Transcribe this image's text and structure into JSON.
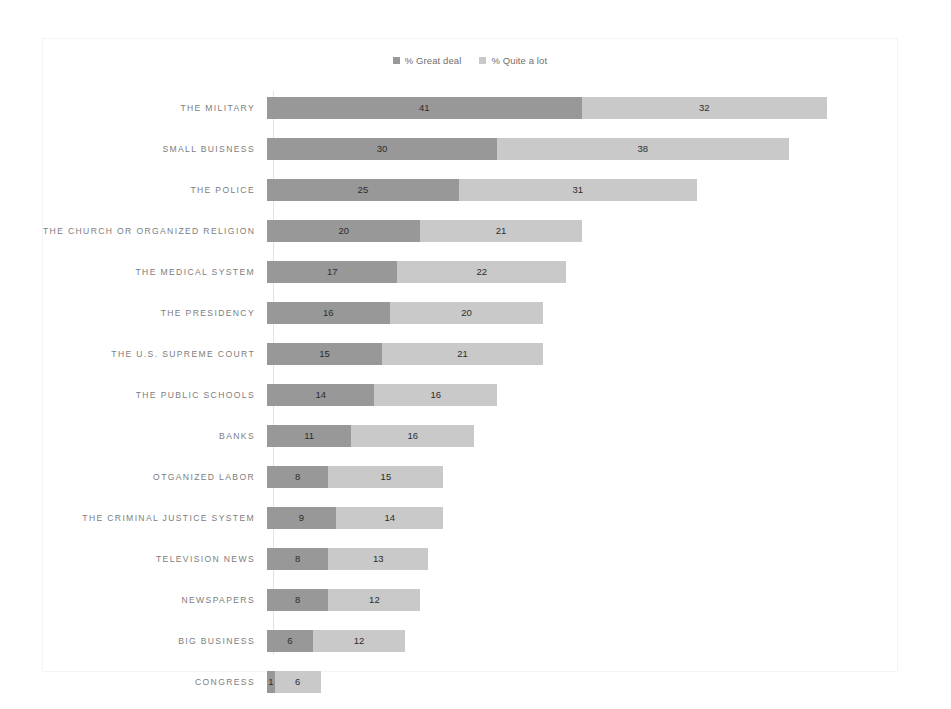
{
  "legend": {
    "items": [
      {
        "label": "% Great deal",
        "color": "#989898",
        "icon": "square-marker"
      },
      {
        "label": "% Quite a lot",
        "color": "#c9c9c9",
        "icon": "square-marker"
      }
    ]
  },
  "chart_data": {
    "type": "bar",
    "orientation": "horizontal",
    "stacked": true,
    "title": "",
    "subtitle": "",
    "xlabel": "",
    "ylabel": "",
    "grid": false,
    "legend_position": "top-center",
    "xlim": [
      0,
      73
    ],
    "axis_tick_labels": [],
    "categories": [
      "THE MILITARY",
      "SMALL BUISNESS",
      "THE POLICE",
      "THE CHURCH OR ORGANIZED RELIGION",
      "THE MEDICAL SYSTEM",
      "THE PRESIDENCY",
      "THE U.S. SUPREME COURT",
      "THE PUBLIC SCHOOLS",
      "BANKS",
      "OTGANIZED LABOR",
      "THE CRIMINAL JUSTICE SYSTEM",
      "TELEVISION NEWS",
      "NEWSPAPERS",
      "BIG BUSINESS",
      "CONGRESS"
    ],
    "series": [
      {
        "name": "% Great deal",
        "color": "#989898",
        "values": [
          41,
          30,
          25,
          20,
          17,
          16,
          15,
          14,
          11,
          8,
          9,
          8,
          8,
          6,
          1
        ]
      },
      {
        "name": "% Quite a lot",
        "color": "#c9c9c9",
        "values": [
          32,
          38,
          31,
          21,
          22,
          20,
          21,
          16,
          16,
          15,
          14,
          13,
          12,
          12,
          6
        ]
      }
    ],
    "totals": [
      73,
      68,
      56,
      41,
      39,
      36,
      36,
      30,
      27,
      23,
      23,
      21,
      20,
      18,
      7
    ]
  }
}
